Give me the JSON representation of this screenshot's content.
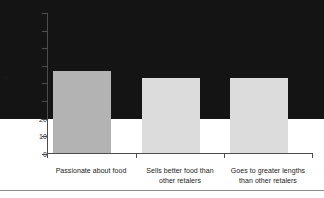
{
  "chart_data": {
    "type": "bar",
    "title": "",
    "subtitle": "",
    "xlabel": "",
    "ylabel": "%",
    "ylim": [
      0,
      80
    ],
    "yticks": [
      0,
      10,
      20,
      30,
      40,
      50,
      60,
      70,
      80
    ],
    "grid": false,
    "legend": "none",
    "categories": [
      "Passionate about food",
      "Sells better food than other retalers",
      "Goes to greater lengths than other retalers"
    ],
    "category_lines": [
      [
        "Passionate about food"
      ],
      [
        "Sells better food than",
        "other retalers"
      ],
      [
        "Goes to greater lengths",
        "than other retalers"
      ]
    ],
    "values": [
      68,
      47,
      43
    ],
    "bar_colors": [
      "#141414",
      "#b3b3b3",
      "#dcdcdc"
    ],
    "bar_edge_colors": [
      "#141414",
      "#a6a6a6",
      "#cfcfcf"
    ],
    "axis_color": "#4d4d4d"
  },
  "ylabels": {
    "t0": "0",
    "t10": "10",
    "t20": "20",
    "t30": "30",
    "t40": "40",
    "t50": "50",
    "t60": "60",
    "t70": "70",
    "t80": "80"
  }
}
